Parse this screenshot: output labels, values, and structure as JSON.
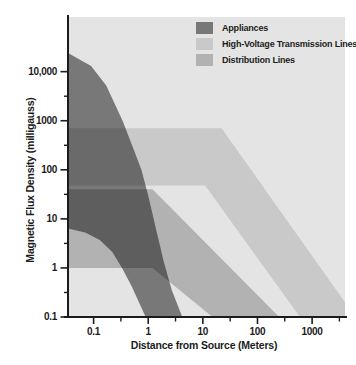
{
  "figure": {
    "background": "#ffffff",
    "plot_background": "#e4e4e4",
    "axis_color": "#1c1c1c",
    "text_color": "#1c1c1c"
  },
  "chart_data": {
    "type": "area",
    "title": "",
    "xlabel": "Distance from Source (Meters)",
    "ylabel": "Magnetic Flux Density (milligauss)",
    "x_scale": "log",
    "y_scale": "log",
    "x_range": [
      0.034,
      4000
    ],
    "y_range": [
      0.1,
      130000
    ],
    "grid": false,
    "legend_position": "top-right",
    "x_ticks": [
      {
        "label": "0.1",
        "value": 0.1
      },
      {
        "label": "1",
        "value": 1
      },
      {
        "label": "10",
        "value": 10
      },
      {
        "label": "100",
        "value": 100
      },
      {
        "label": "1000",
        "value": 1000
      }
    ],
    "x_minor_ticks": [
      0.316,
      3.16,
      31.6,
      316,
      3160
    ],
    "y_ticks": [
      {
        "label": "10,000",
        "value": 10000
      },
      {
        "label": "1000",
        "value": 1000
      },
      {
        "label": "100",
        "value": 100
      },
      {
        "label": "10",
        "value": 10
      },
      {
        "label": "1",
        "value": 1
      },
      {
        "label": "0.1",
        "value": 0.1
      }
    ],
    "y_minor_ticks": [
      0.316,
      3.16,
      31.6,
      316,
      3162
    ],
    "series": [
      {
        "name": "Appliances",
        "color": "#787878",
        "fill_multiply": "#868686",
        "upper_band": [
          [
            0.034,
            24000
          ],
          [
            0.09,
            13000
          ],
          [
            0.17,
            5200
          ],
          [
            0.34,
            1000
          ],
          [
            0.55,
            250
          ],
          [
            0.75,
            100
          ],
          [
            1,
            30
          ],
          [
            1.4,
            6
          ],
          [
            1.9,
            1.4
          ],
          [
            2.7,
            0.35
          ],
          [
            4.2,
            0.1
          ]
        ],
        "lower_band": [
          [
            0.034,
            6.4
          ],
          [
            0.07,
            5.3
          ],
          [
            0.13,
            3.7
          ],
          [
            0.22,
            2.1
          ],
          [
            0.34,
            0.95
          ],
          [
            0.5,
            0.42
          ],
          [
            0.65,
            0.22
          ],
          [
            0.9,
            0.1
          ]
        ]
      },
      {
        "name": "High-Voltage Transmission Lines",
        "color": "#c9c9c9",
        "fill_multiply": "#e1e1e1",
        "upper_band": [
          [
            0.034,
            700
          ],
          [
            22,
            700
          ],
          [
            4000,
            0.2
          ],
          [
            4000,
            0.1
          ]
        ],
        "lower_band": [
          [
            0.034,
            48
          ],
          [
            11,
            48
          ],
          [
            600,
            0.1
          ]
        ]
      },
      {
        "name": "Distribution Lines",
        "color": "#b2b2b2",
        "fill_multiply": "#c7c7c7",
        "upper_band": [
          [
            0.034,
            40
          ],
          [
            1.2,
            40
          ],
          [
            250,
            0.1
          ]
        ],
        "lower_band": [
          [
            0.034,
            1
          ],
          [
            1.2,
            1
          ],
          [
            15,
            0.1
          ]
        ]
      }
    ]
  }
}
